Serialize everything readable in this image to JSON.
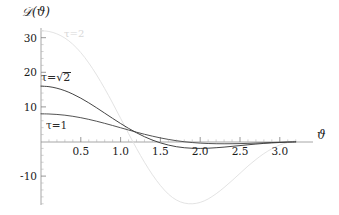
{
  "chart_data": {
    "type": "line",
    "title": "",
    "xlabel": "ϑ",
    "ylabel": "𝒟(ϑ)",
    "xlim": [
      0,
      3.25
    ],
    "ylim": [
      -20,
      33
    ],
    "grid": false,
    "legend_position": "inline-annotations",
    "x_ticks": [
      "0.5",
      "1.0",
      "1.5",
      "2.0",
      "2.5",
      "3.0"
    ],
    "x_tick_values": [
      0.5,
      1.0,
      1.5,
      2.0,
      2.5,
      3.0
    ],
    "y_ticks": [
      "30",
      "20",
      "10",
      "-10"
    ],
    "y_tick_values": [
      30,
      20,
      10,
      -10
    ],
    "series": [
      {
        "name": "τ=1",
        "label": "τ=1",
        "color": "#4a4a4a",
        "x": [
          0.0,
          0.1,
          0.2,
          0.3,
          0.4,
          0.5,
          0.6,
          0.7,
          0.8,
          0.9,
          1.0,
          1.1,
          1.2,
          1.3,
          1.4,
          1.5,
          1.6,
          1.7,
          1.8,
          1.9,
          2.0,
          2.1,
          2.2,
          2.3,
          2.4,
          2.5,
          2.6,
          2.7,
          2.8,
          2.9,
          3.0,
          3.1,
          3.2
        ],
        "values": [
          8.0,
          7.95,
          7.82,
          7.6,
          7.28,
          6.88,
          6.4,
          5.85,
          5.25,
          4.62,
          3.97,
          3.32,
          2.69,
          2.09,
          1.54,
          1.04,
          0.6,
          0.23,
          -0.07,
          -0.3,
          -0.47,
          -0.58,
          -0.64,
          -0.66,
          -0.64,
          -0.6,
          -0.54,
          -0.46,
          -0.38,
          -0.3,
          -0.23,
          -0.16,
          -0.11
        ]
      },
      {
        "name": "τ=√2",
        "label": "τ=√2",
        "color": "#3a3a3a",
        "x": [
          0.0,
          0.1,
          0.2,
          0.3,
          0.4,
          0.5,
          0.6,
          0.7,
          0.8,
          0.9,
          1.0,
          1.1,
          1.2,
          1.3,
          1.4,
          1.5,
          1.6,
          1.7,
          1.8,
          1.9,
          2.0,
          2.1,
          2.2,
          2.3,
          2.4,
          2.5,
          2.6,
          2.7,
          2.8,
          2.9,
          3.0,
          3.1,
          3.2
        ],
        "values": [
          16.0,
          15.85,
          15.4,
          14.68,
          13.7,
          12.52,
          11.18,
          9.72,
          8.2,
          6.68,
          5.2,
          3.8,
          2.52,
          1.38,
          0.4,
          -0.4,
          -1.03,
          -1.5,
          -1.8,
          -1.96,
          -2.0,
          -1.94,
          -1.8,
          -1.62,
          -1.4,
          -1.18,
          -0.95,
          -0.74,
          -0.55,
          -0.4,
          -0.28,
          -0.18,
          -0.1
        ]
      },
      {
        "name": "τ=2",
        "label": "τ=2",
        "color": "#e2e2e2",
        "x": [
          0.0,
          0.1,
          0.2,
          0.3,
          0.4,
          0.5,
          0.6,
          0.7,
          0.8,
          0.9,
          1.0,
          1.1,
          1.2,
          1.3,
          1.4,
          1.5,
          1.6,
          1.7,
          1.8,
          1.9,
          2.0,
          2.1,
          2.2,
          2.3,
          2.4,
          2.5,
          2.6,
          2.7,
          2.8,
          2.9,
          3.0,
          3.1,
          3.2
        ],
        "values": [
          32.0,
          31.8,
          31.1,
          29.9,
          28.1,
          25.7,
          22.7,
          19.2,
          15.3,
          11.1,
          6.7,
          2.3,
          -2.0,
          -6.0,
          -9.6,
          -12.7,
          -15.2,
          -16.9,
          -17.8,
          -18.0,
          -17.6,
          -16.6,
          -15.1,
          -13.3,
          -11.3,
          -9.2,
          -7.1,
          -5.2,
          -3.5,
          -2.1,
          -1.0,
          -0.3,
          0.2
        ]
      }
    ]
  },
  "axis": {
    "y_axis_label_text": "𝒟(ϑ)",
    "x_axis_label_text": "ϑ"
  },
  "annotations": {
    "tau_one": "τ=1",
    "tau_sqrt_two_prefix": "τ=",
    "tau_sqrt_two_radicand": "2",
    "tau_two": "τ=2"
  }
}
